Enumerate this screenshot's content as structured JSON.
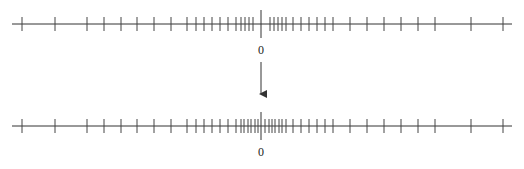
{
  "diagram": {
    "colors": {
      "line": "#333333",
      "tick": "#444444",
      "background": "#ffffff"
    },
    "top_line": {
      "y": 24,
      "x_start": 12,
      "x_end": 512,
      "origin_x": 261,
      "origin_label": "0",
      "ticks_x": [
        22,
        55,
        87,
        104,
        121,
        137,
        154,
        171,
        187,
        196,
        204,
        212,
        220,
        228,
        236,
        241,
        245,
        249,
        253,
        270,
        274,
        278,
        282,
        286,
        293,
        301,
        309,
        317,
        325,
        333,
        350,
        367,
        384,
        401,
        418,
        435,
        471,
        503
      ]
    },
    "arrow": {
      "x": 261,
      "y_start": 62,
      "y_end": 100,
      "direction": "down"
    },
    "bottom_line": {
      "y": 126,
      "x_start": 12,
      "x_end": 512,
      "origin_x": 261,
      "origin_label": "0",
      "ticks_x": [
        22,
        55,
        87,
        104,
        121,
        137,
        154,
        171,
        187,
        196,
        204,
        212,
        220,
        228,
        236,
        241,
        244,
        248,
        251,
        255,
        258,
        265,
        269,
        272,
        275,
        279,
        282,
        286,
        293,
        301,
        309,
        317,
        325,
        333,
        350,
        367,
        384,
        401,
        418,
        435,
        471,
        503
      ]
    }
  }
}
